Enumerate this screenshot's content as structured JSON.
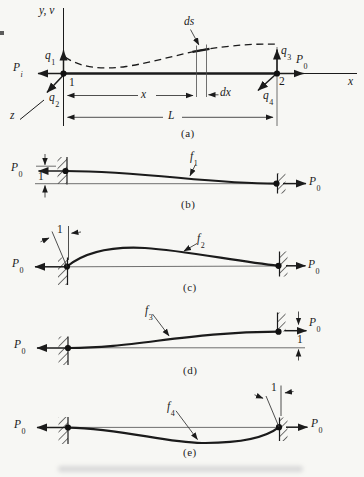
{
  "colors": {
    "ink": "#1b1b1b",
    "paper": "#f7f7f4"
  },
  "shared": {
    "P0": {
      "base": "P",
      "sub": "0"
    },
    "unit": "1"
  },
  "part_a": {
    "caption": "(a)",
    "y_axis": "y, v",
    "x_axis": "x",
    "z_axis": "z",
    "node_1": "1",
    "node_2": "2",
    "q1": {
      "base": "q",
      "sub": "1"
    },
    "q2": {
      "base": "q",
      "sub": "2"
    },
    "q3": {
      "base": "q",
      "sub": "3"
    },
    "q4": {
      "base": "q",
      "sub": "4"
    },
    "Pi": {
      "base": "P",
      "sub": "i"
    },
    "ds": "ds",
    "dx": "dx",
    "x_dim": "x",
    "L_dim": "L"
  },
  "part_b": {
    "caption": "(b)",
    "fn": {
      "base": "f",
      "sub": "1"
    }
  },
  "part_c": {
    "caption": "(c)",
    "fn": {
      "base": "f",
      "sub": "2"
    }
  },
  "part_d": {
    "caption": "(d)",
    "fn": {
      "base": "f",
      "sub": "3"
    }
  },
  "part_e": {
    "caption": "(e)",
    "fn": {
      "base": "f",
      "sub": "4"
    }
  }
}
